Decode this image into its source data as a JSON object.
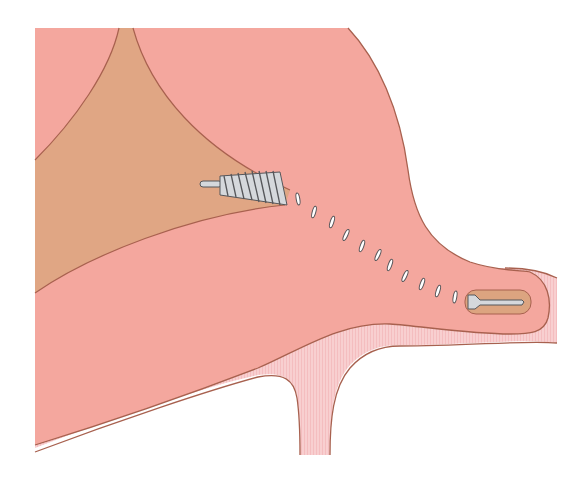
{
  "figure": {
    "type": "anatomical-illustration",
    "colors": {
      "background": "#ffffff",
      "tissue_main": "#f4a79e",
      "tissue_fold": "#e0a684",
      "pale_layer": "#f8cfd0",
      "outline": "#a8614f",
      "implant_fill": "#d5d8dc",
      "implant_outline": "#55565a",
      "capsule_fill": "#dca480"
    },
    "elements": {
      "large_coil": "coil-implant",
      "small_screw": "screw-implant",
      "track_marks_count": 14
    }
  }
}
